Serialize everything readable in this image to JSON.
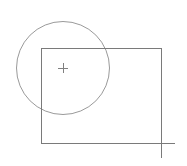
{
  "canvas": {
    "width": 187,
    "height": 166,
    "background": "#ffffff"
  },
  "colors": {
    "circle_stroke": "#9a9a9a",
    "rect_stroke": "#7a7a7a",
    "marker_stroke": "#808080"
  },
  "shapes": {
    "circle": {
      "cx": 63,
      "cy": 68,
      "r": 46.5
    },
    "rectangle": {
      "x": 41,
      "y": 48,
      "width": 120,
      "height": 95
    },
    "center_marker": {
      "x": 63,
      "y": 68,
      "size": 5
    },
    "corner_extension": {
      "x": 161,
      "y": 143,
      "right_to": 175,
      "down_to": 158
    }
  }
}
